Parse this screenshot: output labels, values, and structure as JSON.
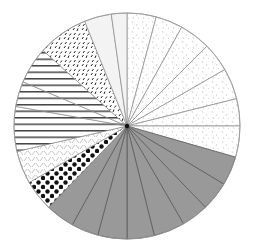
{
  "chart_data": {
    "type": "pie",
    "title": "",
    "start_angle_deg": 0,
    "direction": "clockwise",
    "center": [
      127,
      126
    ],
    "radius": 113,
    "legend": [],
    "slices": [
      {
        "label": "",
        "degrees": 15,
        "pattern": "speckle",
        "color": "#bbbbbb"
      },
      {
        "label": "",
        "degrees": 14,
        "pattern": "speckle",
        "color": "#bbbbbb"
      },
      {
        "label": "",
        "degrees": 16,
        "pattern": "speckle",
        "color": "#bbbbbb"
      },
      {
        "label": "",
        "degrees": 15,
        "pattern": "speckle",
        "color": "#bbbbbb"
      },
      {
        "label": "",
        "degrees": 16,
        "pattern": "speckle",
        "color": "#bbbbbb"
      },
      {
        "label": "",
        "degrees": 14,
        "pattern": "speckle",
        "color": "#bbbbbb"
      },
      {
        "label": "",
        "degrees": 16,
        "pattern": "speckle",
        "color": "#bbbbbb"
      },
      {
        "label": "",
        "degrees": 15,
        "pattern": "solid",
        "color": "#999999"
      },
      {
        "label": "",
        "degrees": 15,
        "pattern": "solid",
        "color": "#999999"
      },
      {
        "label": "",
        "degrees": 14,
        "pattern": "solid",
        "color": "#999999"
      },
      {
        "label": "",
        "degrees": 16,
        "pattern": "solid",
        "color": "#999999"
      },
      {
        "label": "",
        "degrees": 14,
        "pattern": "solid",
        "color": "#999999"
      },
      {
        "label": "",
        "degrees": 15,
        "pattern": "solid",
        "color": "#999999"
      },
      {
        "label": "",
        "degrees": 14,
        "pattern": "solid",
        "color": "#999999"
      },
      {
        "label": "",
        "degrees": 15,
        "pattern": "solid",
        "color": "#999999"
      },
      {
        "label": "",
        "degrees": 16,
        "pattern": "dots",
        "color": "#111111"
      },
      {
        "label": "",
        "degrees": 17,
        "pattern": "herringbone",
        "color": "#aaaaaa"
      },
      {
        "label": "",
        "degrees": 23,
        "pattern": "hstripes",
        "color": "#444444"
      },
      {
        "label": "",
        "degrees": 13,
        "pattern": "hstripes",
        "color": "#444444"
      },
      {
        "label": "",
        "degrees": 19,
        "pattern": "hstripes",
        "color": "#444444"
      },
      {
        "label": "",
        "degrees": 26,
        "pattern": "dashes",
        "color": "#222222"
      },
      {
        "label": "",
        "degrees": 14,
        "pattern": "light",
        "color": "#f2f2f2"
      },
      {
        "label": "",
        "degrees": 8,
        "pattern": "light",
        "color": "#f7f7f7"
      }
    ],
    "stroke_color": "#888888"
  }
}
